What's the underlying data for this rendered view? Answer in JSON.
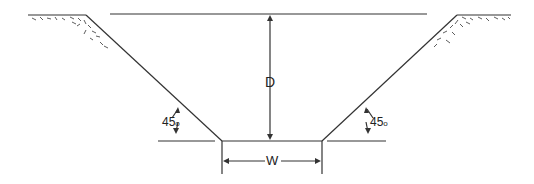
{
  "diagram": {
    "depth_label": "D",
    "width_label": "W",
    "left_angle": {
      "value": "45",
      "unit": "o"
    },
    "right_angle": {
      "value": "45",
      "unit": "o"
    },
    "colors": {
      "line": "#333333",
      "background": "#ffffff"
    }
  }
}
